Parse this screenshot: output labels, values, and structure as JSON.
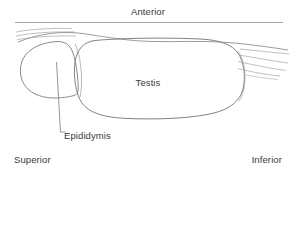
{
  "diagram": {
    "type": "anatomical-line-drawing",
    "background_color": "#ffffff",
    "line_color": "#7a7a7a",
    "text_color": "#3a3a3a",
    "orientation_labels": {
      "top": "Anterior",
      "left": "Superior",
      "right": "Inferior"
    },
    "structure_labels": {
      "testis": "Testis",
      "epididymis": "Epididymis"
    },
    "reference_line": {
      "name": "anterior-baseline",
      "x1": 15,
      "y1": 22,
      "x2": 283,
      "y2": 22
    }
  }
}
